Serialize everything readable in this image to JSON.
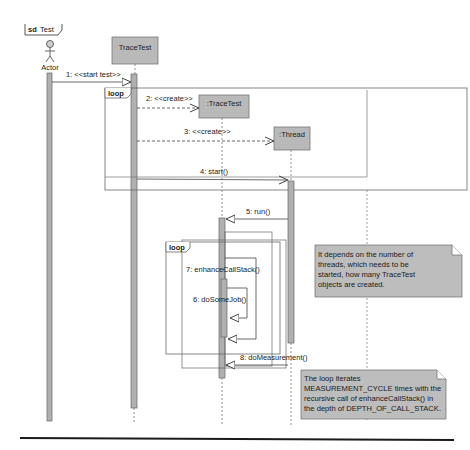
{
  "frame": {
    "keyword": "sd",
    "name": "Test"
  },
  "colors": {
    "participant_fill": "#b9b9b9",
    "activation_fill": "#b0b0b0",
    "note_fill": "#bdbdbd",
    "line": "#555555",
    "footer_rule": "#1a1a1a"
  },
  "participants": [
    {
      "id": "actor",
      "label": "Actor",
      "type": "actor"
    },
    {
      "id": "tracetest_main",
      "label": "TraceTest",
      "type": "object"
    },
    {
      "id": "tracetest_created",
      "label": ":TraceTest",
      "type": "object"
    },
    {
      "id": "thread",
      "label": ":Thread",
      "type": "object"
    }
  ],
  "fragments": [
    {
      "operator": "loop",
      "label": "loop"
    },
    {
      "operator": "loop",
      "label": "loop"
    }
  ],
  "messages": [
    {
      "label": "1: <<start test>>",
      "from": "actor",
      "to": "tracetest_main",
      "kind": "sync"
    },
    {
      "label": "2: <<create>>",
      "from": "tracetest_main",
      "to": "tracetest_created",
      "kind": "create"
    },
    {
      "label": "3: <<create>>",
      "from": "tracetest_main",
      "to": "thread",
      "kind": "create"
    },
    {
      "label": "4: start()",
      "from": "tracetest_main",
      "to": "thread",
      "kind": "sync"
    },
    {
      "label": "5: run()",
      "from": "thread",
      "to": "tracetest_created",
      "kind": "sync"
    },
    {
      "label": "7: enhanceCallStack()",
      "from": "tracetest_created",
      "to": "tracetest_created",
      "kind": "self"
    },
    {
      "label": "6: doSomeJob()",
      "from": "tracetest_created",
      "to": "tracetest_created",
      "kind": "self"
    },
    {
      "label": "8: doMeasurement()",
      "from": "thread",
      "to": "tracetest_created",
      "kind": "sync"
    }
  ],
  "notes": [
    {
      "lines": [
        "It depends on the number of",
        "threads, which needs to be",
        "started, how many TraceTest",
        "objects are created."
      ]
    },
    {
      "lines": [
        "The loop iterates",
        "MEASUREMENT_CYCLE times with the",
        "recursive call of enhanceCallStack() in",
        "the depth of DEPTH_OF_CALL_STACK."
      ]
    }
  ]
}
